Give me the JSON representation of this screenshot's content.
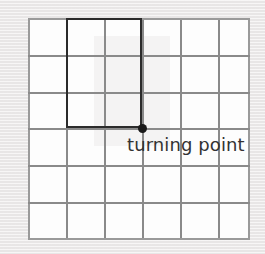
{
  "figure": {
    "kind": "grid-diagram",
    "width": 265,
    "height": 254,
    "background_color": "#edebeb",
    "paper_color": "#fdfdfd"
  },
  "grid": {
    "columns": 6,
    "rows": 6,
    "line_color": "#8a8a8a",
    "border_color": "#9a9a9a",
    "cell_width": 37,
    "cell_height": 37,
    "origin_x": 28,
    "origin_y": 18,
    "vertical_positions": [
      0,
      38,
      76,
      114,
      152,
      190,
      220
    ],
    "horizontal_positions": [
      0,
      37,
      74,
      110,
      147,
      184,
      220
    ]
  },
  "shaded_region": {
    "name": "highlighted-rectangle",
    "fill_color": "#f4f3f3",
    "columns_spanned": 2,
    "rows_spanned": 3,
    "start_column": 2,
    "start_row": 1
  },
  "bold_rectangle": {
    "stroke_color": "#2b2b2b",
    "stroke_width": 2.5,
    "left": 66,
    "top": 18,
    "width": 76,
    "height": 110
  },
  "turning_point": {
    "label": "turning point",
    "marker_color": "#1a1a1a",
    "marker_diameter": 9,
    "center_x": 142,
    "center_y": 128,
    "text_color": "#333333",
    "font_size": 18
  }
}
